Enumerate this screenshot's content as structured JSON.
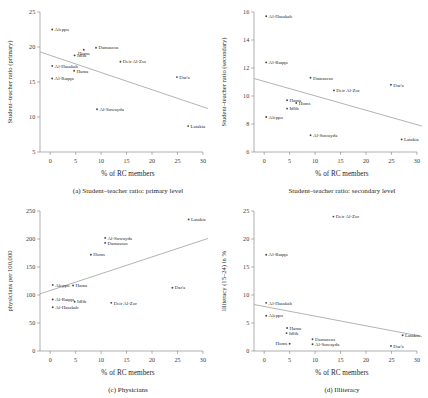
{
  "figure": {
    "panel_count": 4,
    "shared_xlabel": "% of RC members"
  },
  "chart_data": [
    {
      "type": "scatter",
      "id": "a",
      "title": "(a) Student–teacher ratio: primary level",
      "caption": "(a) Student–teacher ratio: primary level",
      "xlabel": "% of RC members",
      "ylabel": "Student–teacher ratio (primary)",
      "xlim": [
        -2,
        31
      ],
      "ylim": [
        5,
        25
      ],
      "xticks": [
        0,
        5,
        10,
        15,
        20,
        25,
        30
      ],
      "yticks": [
        5,
        10,
        15,
        20,
        25
      ],
      "grid": false,
      "legend": "none",
      "trendline": {
        "x0": -2,
        "y0": 19.3,
        "x1": 31,
        "y1": 11.2,
        "slope": -0.245,
        "intercept": 18.8
      },
      "points": [
        {
          "label": "Aleppo",
          "x": 0.4,
          "y": 22.5,
          "label_pos": "right"
        },
        {
          "label": "Damascus",
          "x": 9.0,
          "y": 19.9,
          "label_pos": "right"
        },
        {
          "label": "Homs",
          "x": 6.6,
          "y": 19.6,
          "label_pos": "below"
        },
        {
          "label": "Idlib",
          "x": 4.8,
          "y": 18.8,
          "label_pos": "right"
        },
        {
          "label": "Deir Al-Zor",
          "x": 13.8,
          "y": 17.9,
          "label_pos": "right"
        },
        {
          "label": "Al-Hasakah",
          "x": 0.4,
          "y": 17.3,
          "label_pos": "right"
        },
        {
          "label": "Hama",
          "x": 4.7,
          "y": 16.6,
          "label_pos": "right"
        },
        {
          "label": "Dar'a",
          "x": 24.9,
          "y": 15.7,
          "label_pos": "right"
        },
        {
          "label": "Al-Raqqa",
          "x": 0.4,
          "y": 15.5,
          "label_pos": "right"
        },
        {
          "label": "Al-Suwayda",
          "x": 9.2,
          "y": 11.1,
          "label_pos": "right"
        },
        {
          "label": "Latakia",
          "x": 27.1,
          "y": 8.7,
          "label_pos": "right"
        }
      ]
    },
    {
      "type": "scatter",
      "id": "b",
      "title": "Student–teacher ratio: secondary level",
      "caption": "Student–teacher ratio: secondary level",
      "xlabel": "% of RC members",
      "ylabel": "Student–teacher ratio (secondary)",
      "xlim": [
        -2,
        31
      ],
      "ylim": [
        6,
        16
      ],
      "xticks": [
        0,
        5,
        10,
        15,
        20,
        25,
        30
      ],
      "yticks": [
        6,
        8,
        10,
        12,
        14,
        16
      ],
      "grid": false,
      "legend": "none",
      "trendline": {
        "x0": -2,
        "y0": 11.25,
        "x1": 31,
        "y1": 7.85,
        "slope": -0.103,
        "intercept": 11.05
      },
      "points": [
        {
          "label": "Al-Hasakah",
          "x": 0.4,
          "y": 15.7,
          "label_pos": "right"
        },
        {
          "label": "Al-Raqqa",
          "x": 0.4,
          "y": 12.4,
          "label_pos": "right"
        },
        {
          "label": "Damascus",
          "x": 9.1,
          "y": 11.3,
          "label_pos": "right"
        },
        {
          "label": "Dar'a",
          "x": 24.9,
          "y": 10.8,
          "label_pos": "right"
        },
        {
          "label": "Deir Al-Zor",
          "x": 13.7,
          "y": 10.4,
          "label_pos": "right"
        },
        {
          "label": "Hama",
          "x": 4.5,
          "y": 9.7,
          "label_pos": "right"
        },
        {
          "label": "Homs",
          "x": 6.3,
          "y": 9.5,
          "label_pos": "right"
        },
        {
          "label": "Idlib",
          "x": 4.5,
          "y": 9.1,
          "label_pos": "right"
        },
        {
          "label": "Aleppo",
          "x": 0.4,
          "y": 8.5,
          "label_pos": "right"
        },
        {
          "label": "Al-Suwayda",
          "x": 9.1,
          "y": 7.2,
          "label_pos": "right"
        },
        {
          "label": "Latakia",
          "x": 27.0,
          "y": 6.9,
          "label_pos": "right"
        }
      ]
    },
    {
      "type": "scatter",
      "id": "c",
      "title": "(c) Physicians",
      "caption": "(c) Physicians",
      "xlabel": "% of RC members",
      "ylabel": "physicians per 100,000",
      "xlim": [
        -2,
        31
      ],
      "ylim": [
        0,
        250
      ],
      "xticks": [
        0,
        5,
        10,
        15,
        20,
        25,
        30
      ],
      "yticks": [
        0,
        50,
        100,
        150,
        200,
        250
      ],
      "grid": false,
      "legend": "none",
      "trendline": {
        "x0": -2,
        "y0": 102,
        "x1": 31,
        "y1": 201,
        "slope": 3.0,
        "intercept": 108
      },
      "points": [
        {
          "label": "Latakia",
          "x": 27.2,
          "y": 235,
          "label_pos": "right"
        },
        {
          "label": "Al-Suwayda",
          "x": 10.8,
          "y": 202,
          "label_pos": "right"
        },
        {
          "label": "Damascus",
          "x": 10.8,
          "y": 193,
          "label_pos": "right"
        },
        {
          "label": "Homs",
          "x": 8.0,
          "y": 172,
          "label_pos": "right"
        },
        {
          "label": "Aleppo",
          "x": 0.5,
          "y": 118,
          "label_pos": "right"
        },
        {
          "label": "Hama",
          "x": 4.5,
          "y": 117,
          "label_pos": "right"
        },
        {
          "label": "Dar'a",
          "x": 24.0,
          "y": 113,
          "label_pos": "right"
        },
        {
          "label": "Al-Raqqa",
          "x": 0.5,
          "y": 92,
          "label_pos": "right"
        },
        {
          "label": "Idlib",
          "x": 4.8,
          "y": 88,
          "label_pos": "right"
        },
        {
          "label": "Deir Al-Zor",
          "x": 12.0,
          "y": 86,
          "label_pos": "right"
        },
        {
          "label": "Al-Hasakah",
          "x": 0.5,
          "y": 78,
          "label_pos": "right"
        }
      ]
    },
    {
      "type": "scatter",
      "id": "d",
      "title": "(d) Illiteracy",
      "caption": "(d) Illiteracy",
      "xlabel": "% of RC members",
      "ylabel": "illiteracy (15–24) in %",
      "xlim": [
        -2,
        31
      ],
      "ylim": [
        0,
        25
      ],
      "xticks": [
        0,
        5,
        10,
        15,
        20,
        25,
        30
      ],
      "yticks": [
        0,
        5,
        10,
        15,
        20,
        25
      ],
      "grid": false,
      "legend": "none",
      "trendline": {
        "x0": -2,
        "y0": 8.3,
        "x1": 31,
        "y1": 2.6,
        "slope": -0.173,
        "intercept": 7.95
      },
      "points": [
        {
          "label": "Deir Al-Zor",
          "x": 13.6,
          "y": 24.0,
          "label_pos": "right"
        },
        {
          "label": "Al-Raqqa",
          "x": 0.4,
          "y": 17.2,
          "label_pos": "right"
        },
        {
          "label": "Al-Hasakah",
          "x": 0.4,
          "y": 8.6,
          "label_pos": "right"
        },
        {
          "label": "Aleppo",
          "x": 0.4,
          "y": 6.3,
          "label_pos": "right"
        },
        {
          "label": "Hama",
          "x": 4.5,
          "y": 4.1,
          "label_pos": "right"
        },
        {
          "label": "Idlib",
          "x": 4.4,
          "y": 3.2,
          "label_pos": "right"
        },
        {
          "label": "Latakia",
          "x": 27.2,
          "y": 2.8,
          "label_pos": "right"
        },
        {
          "label": "Damascus",
          "x": 9.5,
          "y": 2.1,
          "label_pos": "right"
        },
        {
          "label": "Homs",
          "x": 5.0,
          "y": 1.3,
          "label_pos": "left"
        },
        {
          "label": "Al-Suwayda",
          "x": 9.5,
          "y": 1.2,
          "label_pos": "right"
        },
        {
          "label": "Dar'a",
          "x": 24.9,
          "y": 0.9,
          "label_pos": "right"
        }
      ]
    }
  ],
  "colors": {
    "point": "#4a4a4a",
    "trendline": "#9a9a9a",
    "axis": "#8c8c8c",
    "text": "#1f1f1f",
    "background": "#ffffff"
  }
}
